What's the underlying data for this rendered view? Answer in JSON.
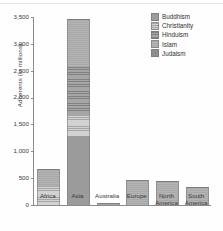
{
  "chart_data": {
    "type": "bar",
    "subtype": "stacked",
    "title": "",
    "xlabel": "",
    "ylabel": "Adherents (in millions)",
    "ylim": [
      0,
      3500
    ],
    "yticks": [
      "0",
      "500",
      "1,000",
      "1,500",
      "2,000",
      "2,500",
      "3,000",
      "3,500"
    ],
    "ytick_values": [
      0,
      500,
      1000,
      1500,
      2000,
      2500,
      3000,
      3500
    ],
    "grid": false,
    "legend_position": "top-right",
    "categories": [
      "Africa",
      "Asia",
      "Australia",
      "Europe",
      "North America",
      "South America"
    ],
    "series": [
      {
        "name": "Buddhism",
        "color": "#9b9b9b",
        "values": [
          0,
          1270,
          0,
          0,
          0,
          0
        ]
      },
      {
        "name": "Christianity",
        "color": "#d2d2d2",
        "values": [
          350,
          400,
          20,
          0,
          0,
          0
        ]
      },
      {
        "name": "Hinduism",
        "color": "#a6a6a6",
        "values": [
          0,
          880,
          0,
          0,
          0,
          0
        ]
      },
      {
        "name": "Islam",
        "color": "#b4b4b4",
        "values": [
          310,
          900,
          5,
          470,
          450,
          340
        ]
      },
      {
        "name": "Judaism",
        "color": "#8e8e8e",
        "values": [
          0,
          0,
          0,
          0,
          0,
          0
        ]
      }
    ],
    "totals": [
      660,
      3450,
      25,
      470,
      450,
      340
    ]
  },
  "legend": {
    "items": [
      {
        "label": "Buddhism",
        "swatch": "buddhism-swatch"
      },
      {
        "label": "Christianity",
        "swatch": "christianity-swatch"
      },
      {
        "label": "Hinduism",
        "swatch": "hinduism-swatch"
      },
      {
        "label": "Islam",
        "swatch": "islam-swatch"
      },
      {
        "label": "Judaism",
        "swatch": "judaism-swatch"
      }
    ]
  },
  "axes": {
    "y_label": "Adherents (in millions)",
    "y_ticks": [
      "3,500",
      "3,000",
      "2,500",
      "2,000",
      "1,500",
      "1,000",
      "500",
      "0"
    ],
    "x_labels": [
      "Africa",
      "Asia",
      "Australia",
      "Europe",
      "North\nAmerica",
      "South\nAmerica"
    ]
  }
}
